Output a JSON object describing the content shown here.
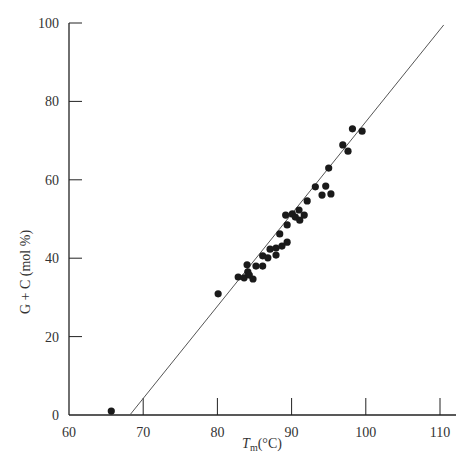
{
  "chart_data": {
    "type": "scatter",
    "title": "",
    "xlabel": "T_m (°C)",
    "xlabel_main": "T",
    "xlabel_sub": "m",
    "xlabel_unit": "(°C)",
    "ylabel": "G + C (mol %)",
    "xlim": [
      60,
      112
    ],
    "ylim": [
      0,
      100
    ],
    "x_ticks": [
      60,
      70,
      80,
      90,
      100,
      110
    ],
    "y_ticks": [
      0,
      20,
      40,
      60,
      80,
      100
    ],
    "grid": false,
    "legend": null,
    "series": [
      {
        "name": "DNA samples",
        "marker": "filled-circle",
        "color": "#1a1a1a",
        "points": [
          [
            65.7,
            1.0
          ],
          [
            80.1,
            30.9
          ],
          [
            82.8,
            35.2
          ],
          [
            83.6,
            35.0
          ],
          [
            84.1,
            36.5
          ],
          [
            84.0,
            38.3
          ],
          [
            84.3,
            35.7
          ],
          [
            84.8,
            34.7
          ],
          [
            85.2,
            38.0
          ],
          [
            86.1,
            38.0
          ],
          [
            86.1,
            40.6
          ],
          [
            86.8,
            40.1
          ],
          [
            87.1,
            42.3
          ],
          [
            87.9,
            40.8
          ],
          [
            87.9,
            42.6
          ],
          [
            88.7,
            43.1
          ],
          [
            88.4,
            46.2
          ],
          [
            89.4,
            44.1
          ],
          [
            89.4,
            48.5
          ],
          [
            89.2,
            51.0
          ],
          [
            90.1,
            51.3
          ],
          [
            90.5,
            50.5
          ],
          [
            91.1,
            49.7
          ],
          [
            91.0,
            52.3
          ],
          [
            91.7,
            51.0
          ],
          [
            92.1,
            54.6
          ],
          [
            93.2,
            58.2
          ],
          [
            94.1,
            56.1
          ],
          [
            94.6,
            58.4
          ],
          [
            95.3,
            56.4
          ],
          [
            95.0,
            63.0
          ],
          [
            96.9,
            68.9
          ],
          [
            97.6,
            67.3
          ],
          [
            98.2,
            73.0
          ],
          [
            99.5,
            72.4
          ]
        ]
      }
    ],
    "fit_line": {
      "name": "linear fit",
      "color": "#555555",
      "from": [
        68.2,
        0
      ],
      "to": [
        110.5,
        99.5
      ]
    }
  },
  "axes": {
    "color": "#222222"
  }
}
